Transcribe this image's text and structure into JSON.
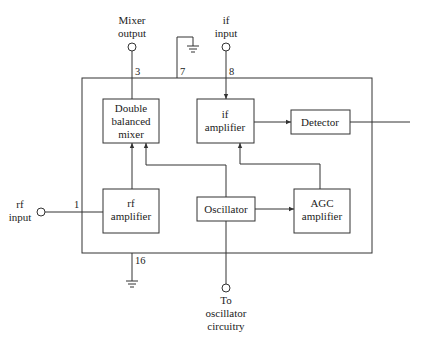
{
  "diagram": {
    "type": "block-diagram",
    "blocks": {
      "mixer": {
        "lines": [
          "Double",
          "balanced",
          "mixer"
        ]
      },
      "if_amp": {
        "lines": [
          "if",
          "amplifier"
        ]
      },
      "detector": {
        "lines": [
          "Detector"
        ]
      },
      "rf_amp": {
        "lines": [
          "rf",
          "amplifier"
        ]
      },
      "oscillator": {
        "lines": [
          "Oscillator"
        ]
      },
      "agc_amp": {
        "lines": [
          "AGC",
          "amplifier"
        ]
      }
    },
    "terminals": {
      "mixer_output": {
        "lines": [
          "Mixer",
          "output"
        ],
        "pin": "3"
      },
      "ground_top": {
        "pin": "7"
      },
      "if_input": {
        "lines": [
          "if",
          "input"
        ],
        "pin": "8"
      },
      "rf_input": {
        "lines": [
          "rf",
          "input"
        ],
        "pin": "1"
      },
      "ground_bottom": {
        "pin": "16"
      },
      "osc_circuitry": {
        "lines": [
          "To",
          "oscillator",
          "circuitry"
        ]
      }
    },
    "connections": [
      {
        "from": "rf_input",
        "to": "rf_amp"
      },
      {
        "from": "rf_amp",
        "to": "mixer"
      },
      {
        "from": "oscillator",
        "to": "mixer"
      },
      {
        "from": "mixer",
        "to": "mixer_output"
      },
      {
        "from": "if_input",
        "to": "if_amp"
      },
      {
        "from": "if_amp",
        "to": "detector"
      },
      {
        "from": "oscillator",
        "to": "agc_amp"
      },
      {
        "from": "agc_amp",
        "to": "if_amp"
      },
      {
        "from": "oscillator",
        "to": "osc_circuitry"
      },
      {
        "from": "detector",
        "to": "output"
      }
    ]
  }
}
